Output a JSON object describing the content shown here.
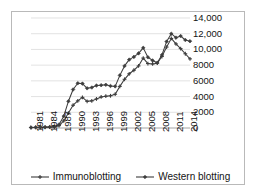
{
  "chart_data": {
    "type": "line",
    "title": "",
    "xlabel": "",
    "ylabel": "",
    "ylim": [
      0,
      14000
    ],
    "ytick_values": [
      0,
      2000,
      4000,
      6000,
      8000,
      10000,
      12000,
      14000
    ],
    "ytick_labels": [
      "0",
      "2000",
      "4000",
      "6000",
      "8000",
      "10,000",
      "12,000",
      "14,000"
    ],
    "grid": true,
    "legend_position": "bottom",
    "x": [
      1981,
      1982,
      1983,
      1984,
      1985,
      1986,
      1987,
      1988,
      1989,
      1990,
      1991,
      1992,
      1993,
      1994,
      1995,
      1996,
      1997,
      1998,
      1999,
      2000,
      2001,
      2002,
      2003,
      2004,
      2005,
      2006,
      2007,
      2008,
      2009,
      2010,
      2011,
      2012,
      2013,
      2014,
      2015
    ],
    "xtick_labels": [
      "1981",
      "1984",
      "1987",
      "1990",
      "1993",
      "1996",
      "1999",
      "2002",
      "2005",
      "2008",
      "2011",
      "2014"
    ],
    "xtick_values": [
      1981,
      1984,
      1987,
      1990,
      1993,
      1996,
      1999,
      2002,
      2005,
      2008,
      2011,
      2014
    ],
    "series": [
      {
        "name": "Immunoblotting",
        "marker": "plus",
        "color": "#3d3d3d",
        "values": [
          60,
          70,
          80,
          90,
          110,
          140,
          300,
          900,
          1900,
          2900,
          3450,
          3900,
          3400,
          3450,
          3700,
          3950,
          4050,
          4100,
          4300,
          5300,
          6200,
          6900,
          7350,
          7900,
          8900,
          8200,
          8150,
          8250,
          9100,
          10300,
          11400,
          10700,
          10100,
          9450,
          8800
        ]
      },
      {
        "name": "Western blotting",
        "marker": "diamond",
        "color": "#3d3d3d",
        "values": [
          70,
          80,
          95,
          110,
          130,
          170,
          450,
          1500,
          3400,
          4900,
          5700,
          5650,
          5050,
          5150,
          5400,
          5450,
          5500,
          5350,
          5300,
          6700,
          7900,
          8700,
          9050,
          9500,
          10200,
          9000,
          8600,
          8300,
          9300,
          11000,
          12000,
          11500,
          11700,
          11200,
          11050
        ]
      }
    ]
  },
  "legend": {
    "items": [
      {
        "label": "Immunoblotting",
        "marker": "plus-marker-icon"
      },
      {
        "label": "Western blotting",
        "marker": "diamond-marker-icon"
      }
    ]
  }
}
